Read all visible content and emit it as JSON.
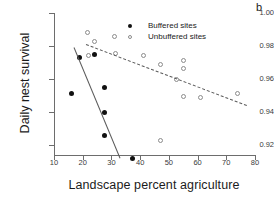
{
  "panel_label": "b",
  "legend": {
    "position": "top-right-inside",
    "items": [
      {
        "marker": "filled-circle",
        "label": "Buffered sites"
      },
      {
        "marker": "open-circle",
        "label": "Unbuffered sites"
      }
    ]
  },
  "axes": {
    "x_label": "Landscape percent agriculture",
    "y_label": "Daily nest survival",
    "x_ticks": [
      "10",
      "20",
      "30",
      "40",
      "50",
      "60",
      "70",
      "80"
    ],
    "y_ticks": [
      "1.00",
      "0.98",
      "0.96",
      "0.94",
      "0.92"
    ]
  },
  "colors": {
    "buffered_marker": "#111111",
    "unbuffered_marker": "#8c8c8c",
    "trend_line": "#5a5a5a",
    "axis": "#6d6d6d",
    "background": "#ffffff"
  },
  "chart_data": {
    "type": "scatter",
    "title": "",
    "panel": "b",
    "xlabel": "Landscape percent agriculture",
    "ylabel": "Daily nest survival",
    "xlim": [
      10,
      80
    ],
    "ylim": [
      0.91,
      1.0
    ],
    "xticks": [
      10,
      20,
      30,
      40,
      50,
      60,
      70,
      80
    ],
    "yticks": [
      0.92,
      0.94,
      0.96,
      0.98,
      1.0
    ],
    "grid": false,
    "series": [
      {
        "name": "Buffered sites",
        "marker": "filled-circle",
        "points": [
          {
            "x": 16.0,
            "y": 0.951
          },
          {
            "x": 19.0,
            "y": 0.973
          },
          {
            "x": 24.0,
            "y": 0.975
          },
          {
            "x": 27.5,
            "y": 0.955
          },
          {
            "x": 27.5,
            "y": 0.94
          },
          {
            "x": 27.5,
            "y": 0.926
          },
          {
            "x": 37.5,
            "y": 0.912
          }
        ],
        "trend_line": {
          "style": "solid",
          "x_start": 17.0,
          "y_start": 0.9795,
          "x_end": 33.0,
          "y_end": 0.9125
        }
      },
      {
        "name": "Unbuffered sites",
        "marker": "open-circle",
        "points": [
          {
            "x": 21.5,
            "y": 0.988
          },
          {
            "x": 22.0,
            "y": 0.974
          },
          {
            "x": 24.0,
            "y": 0.983
          },
          {
            "x": 31.0,
            "y": 0.986
          },
          {
            "x": 31.5,
            "y": 0.9755
          },
          {
            "x": 41.0,
            "y": 0.9745
          },
          {
            "x": 47.0,
            "y": 0.969
          },
          {
            "x": 47.0,
            "y": 0.923
          },
          {
            "x": 52.5,
            "y": 0.9595
          },
          {
            "x": 55.0,
            "y": 0.971
          },
          {
            "x": 55.0,
            "y": 0.9665
          },
          {
            "x": 55.0,
            "y": 0.9495
          },
          {
            "x": 61.0,
            "y": 0.9485
          },
          {
            "x": 74.0,
            "y": 0.951
          }
        ],
        "trend_line": {
          "style": "dashed",
          "x_start": 21.0,
          "y_start": 0.9815,
          "x_end": 77.0,
          "y_end": 0.9445
        }
      }
    ]
  }
}
